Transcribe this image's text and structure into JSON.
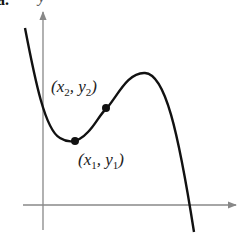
{
  "figure": {
    "part_label": "a.",
    "y_axis_label": "y",
    "points": [
      {
        "name": "x2",
        "label_x": "x",
        "sub_x": "2",
        "label_y": "y",
        "sub_y": "2"
      },
      {
        "name": "x1",
        "label_x": "x",
        "sub_x": "1",
        "label_y": "y",
        "sub_y": "1"
      }
    ],
    "colors": {
      "axis": "#888888",
      "curve": "#111111",
      "text": "#222222"
    }
  }
}
